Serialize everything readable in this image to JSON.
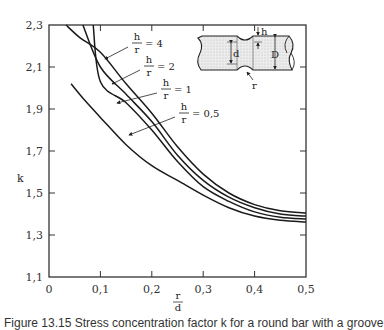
{
  "chart_data": {
    "type": "line",
    "title": "",
    "xlabel": "r/d",
    "xlabel_num": "r",
    "xlabel_den": "d",
    "ylabel": "k",
    "xlim": [
      0,
      0.5
    ],
    "ylim": [
      1.1,
      2.3
    ],
    "grid": false,
    "x_ticks": [
      0,
      0.1,
      0.2,
      0.3,
      0.4,
      0.5
    ],
    "x_tick_labels": [
      "0",
      "0,1",
      "0,2",
      "0,3",
      "0,4",
      "0,5"
    ],
    "y_ticks": [
      1.1,
      1.3,
      1.5,
      1.7,
      1.9,
      2.1,
      2.3
    ],
    "y_tick_labels": [
      "1,1",
      "1,3",
      "1,5",
      "1,7",
      "1,9",
      "2,1",
      "2,3"
    ],
    "series": [
      {
        "name": "h/r = 4",
        "label_num": "h",
        "label_den": "r",
        "label_value": "= 4",
        "x": [
          0.033,
          0.06,
          0.1,
          0.15,
          0.2,
          0.25,
          0.3,
          0.35,
          0.4,
          0.45,
          0.5
        ],
        "y": [
          2.3,
          2.24,
          2.17,
          2.02,
          1.88,
          1.72,
          1.59,
          1.5,
          1.445,
          1.415,
          1.405
        ]
      },
      {
        "name": "h/r = 2",
        "label_num": "h",
        "label_den": "r",
        "label_value": "= 2",
        "x": [
          0.066,
          0.1,
          0.15,
          0.2,
          0.25,
          0.3,
          0.35,
          0.4,
          0.45,
          0.5
        ],
        "y": [
          2.3,
          2.1,
          1.97,
          1.84,
          1.68,
          1.56,
          1.48,
          1.43,
          1.4,
          1.39
        ]
      },
      {
        "name": "h/r = 1",
        "label_num": "h",
        "label_den": "r",
        "label_value": "= 1",
        "x": [
          0.086,
          0.1,
          0.15,
          0.2,
          0.25,
          0.3,
          0.35,
          0.4,
          0.45,
          0.5
        ],
        "y": [
          2.3,
          2.03,
          1.93,
          1.8,
          1.65,
          1.53,
          1.46,
          1.41,
          1.385,
          1.376
        ]
      },
      {
        "name": "h/r = 0,5",
        "label_num": "h",
        "label_den": "r",
        "label_value": "= 0,5",
        "x": [
          0.043,
          0.07,
          0.1,
          0.15,
          0.2,
          0.25,
          0.3,
          0.35,
          0.4,
          0.45,
          0.5
        ],
        "y": [
          2.02,
          1.94,
          1.86,
          1.73,
          1.63,
          1.56,
          1.49,
          1.43,
          1.39,
          1.37,
          1.362
        ]
      }
    ],
    "inset": {
      "description": "Round bar with circumferential groove",
      "labels": {
        "h": "h",
        "d": "d",
        "D": "D",
        "r": "r"
      }
    }
  },
  "caption": "Figure 13.15  Stress concentration factor k for a round bar with a groove"
}
